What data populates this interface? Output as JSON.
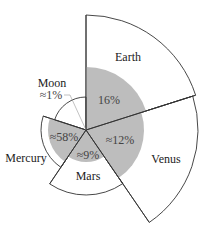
{
  "chart_data": {
    "type": "polar-area",
    "title": "",
    "center": [
      86,
      130
    ],
    "sectors": [
      {
        "name": "Earth",
        "start_deg": -90,
        "end_deg": -17.6,
        "outer_r": 115,
        "gray_r": 63,
        "value_label": "16%"
      },
      {
        "name": "Venus",
        "start_deg": -17.6,
        "end_deg": 55.6,
        "outer_r": 112,
        "gray_r": 58,
        "value_label": "≈12%"
      },
      {
        "name": "Mars",
        "start_deg": 55.6,
        "end_deg": 124,
        "outer_r": 65,
        "gray_r": 32,
        "value_label": "≈9%"
      },
      {
        "name": "Mercury",
        "start_deg": 124,
        "end_deg": 198,
        "outer_r": 45,
        "gray_r": 38,
        "value_label": "≈58%"
      },
      {
        "name": "Moon",
        "start_deg": 198,
        "end_deg": 270,
        "outer_r": 33,
        "gray_r": 0,
        "value_label": "≈1%"
      }
    ],
    "colors": {
      "fill": "#bdbdbd",
      "stroke": "#333333",
      "background": "#ffffff"
    }
  },
  "labels": {
    "earth": "Earth",
    "venus": "Venus",
    "mars": "Mars",
    "mercury": "Mercury",
    "moon": "Moon",
    "earth_pct": "16%",
    "venus_pct": "≈12%",
    "mars_pct": "≈9%",
    "mercury_pct": "≈58%",
    "moon_pct": "≈1%"
  }
}
